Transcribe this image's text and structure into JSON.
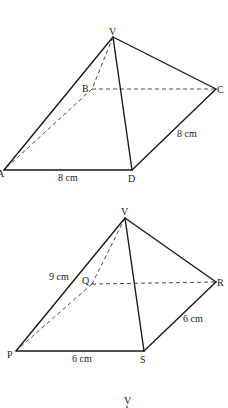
{
  "figures": [
    {
      "name": "pyramid-VABCD",
      "vertices": {
        "V": {
          "label": "V",
          "x": 113,
          "y": 37
        },
        "A": {
          "label": "A",
          "x": 4,
          "y": 170
        },
        "B": {
          "label": "B",
          "x": 92,
          "y": 89
        },
        "C": {
          "label": "C",
          "x": 216,
          "y": 89
        },
        "D": {
          "label": "D",
          "x": 132,
          "y": 170
        }
      },
      "measurements": {
        "AD": "8 cm",
        "DC": "8 cm"
      }
    },
    {
      "name": "pyramid-VPQRS",
      "vertices": {
        "V": {
          "label": "V",
          "x": 125,
          "y": 218
        },
        "P": {
          "label": "P",
          "x": 16,
          "y": 351
        },
        "Q": {
          "label": "Q",
          "x": 92,
          "y": 284
        },
        "R": {
          "label": "R",
          "x": 216,
          "y": 282
        },
        "S": {
          "label": "S",
          "x": 144,
          "y": 351
        }
      },
      "measurements": {
        "VP": "9 cm",
        "PS": "6 cm",
        "SR": "6 cm"
      }
    },
    {
      "name": "partial-figure",
      "vertices": {
        "V": {
          "label": "V",
          "x": 127,
          "y": 403
        }
      }
    }
  ]
}
